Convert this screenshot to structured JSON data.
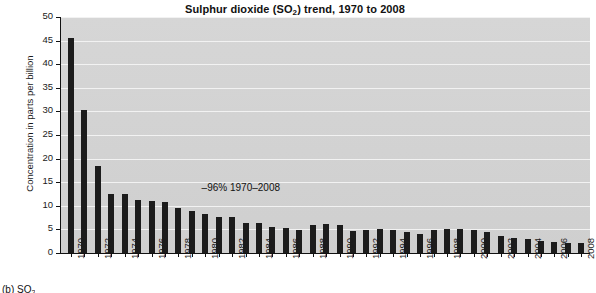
{
  "chart_data": {
    "type": "bar",
    "title": "Sulphur dioxide (SO2) trend, 1970 to 2008",
    "title_main": "Sulphur dioxide (SO",
    "title_sub": "2",
    "title_tail": ") trend, 1970 to 2008",
    "xlabel": "",
    "ylabel": "Concentration in parts per billion",
    "ylim": [
      0,
      50
    ],
    "ytick_values": [
      0,
      5,
      10,
      15,
      20,
      25,
      30,
      35,
      40,
      45,
      50
    ],
    "ytick_labels": [
      "0",
      "5",
      "10",
      "15",
      "20",
      "25",
      "30",
      "35",
      "40",
      "45",
      "50"
    ],
    "grid": true,
    "grid_axis": "y",
    "legend": false,
    "bar_color": "#1c1c1c",
    "plot_background": "#d2d2d2",
    "gridline_color": "#f2f2f2",
    "categories": [
      "1970",
      "1971",
      "1972",
      "1973",
      "1974",
      "1975",
      "1976",
      "1977",
      "1978",
      "1979",
      "1980",
      "1981",
      "1982",
      "1983",
      "1984",
      "1985",
      "1986",
      "1987",
      "1988",
      "1989",
      "1990",
      "1991",
      "1992",
      "1993",
      "1994",
      "1995",
      "1996",
      "1997",
      "1998",
      "1999",
      "2000",
      "2001",
      "2002",
      "2003",
      "2004",
      "2005",
      "2006",
      "2007",
      "2008"
    ],
    "xtick_labels_shown": [
      "1970",
      "1972",
      "1974",
      "1976",
      "1978",
      "1980",
      "1982",
      "1984",
      "1986",
      "1988",
      "1990",
      "1992",
      "1994",
      "1996",
      "1998",
      "2000",
      "2002",
      "2004",
      "2006",
      "2008"
    ],
    "values": [
      45.5,
      30.2,
      18.5,
      12.5,
      12.4,
      11.3,
      11.1,
      10.8,
      9.5,
      8.8,
      8.3,
      7.7,
      7.7,
      6.3,
      6.3,
      5.6,
      5.4,
      4.8,
      6.0,
      6.1,
      5.9,
      4.7,
      4.8,
      5.0,
      4.8,
      4.5,
      4.1,
      4.9,
      5.0,
      5.1,
      4.9,
      4.4,
      3.5,
      3.2,
      2.9,
      2.5,
      2.3,
      2.2,
      2.1
    ],
    "annotations": [
      {
        "text": "–96% 1970–2008",
        "x_category": "1983",
        "y_value": 13.5
      }
    ]
  },
  "figure_caption": "(b) SO",
  "figure_caption_sub": "2"
}
